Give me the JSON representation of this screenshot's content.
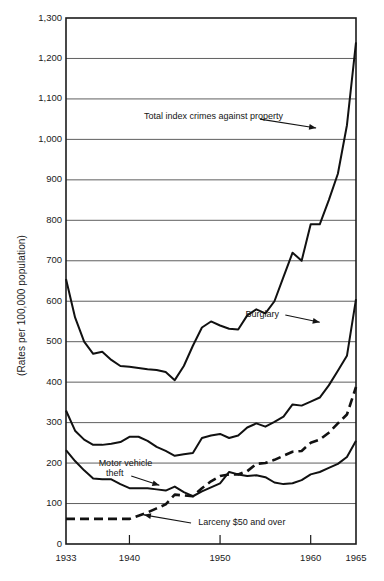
{
  "chart_data": {
    "type": "line",
    "title": "",
    "xlabel": "",
    "ylabel": "(Rates per 100,000 population)",
    "xlim": [
      1933,
      1965
    ],
    "ylim": [
      0,
      1300
    ],
    "grid": true,
    "legend_position": "inline-annotations",
    "y_ticks": [
      "0",
      "100",
      "200",
      "300",
      "400",
      "500",
      "600",
      "700",
      "800",
      "900",
      "1,000",
      "1,100",
      "1,200",
      "1,300"
    ],
    "y_tick_values": [
      0,
      100,
      200,
      300,
      400,
      500,
      600,
      700,
      800,
      900,
      1000,
      1100,
      1200,
      1300
    ],
    "x_ticks": [
      "1933",
      "1940",
      "1950",
      "1960",
      "1965"
    ],
    "x_tick_values": [
      1933,
      1940,
      1950,
      1960,
      1965
    ],
    "x": [
      1933,
      1934,
      1935,
      1936,
      1937,
      1938,
      1939,
      1940,
      1941,
      1942,
      1943,
      1944,
      1945,
      1946,
      1947,
      1948,
      1949,
      1950,
      1951,
      1952,
      1953,
      1954,
      1955,
      1956,
      1957,
      1958,
      1959,
      1960,
      1961,
      1962,
      1963,
      1964,
      1965
    ],
    "series": [
      {
        "name": "Total index crimes against property",
        "style": "solid",
        "color": "#111111",
        "values": [
          655,
          560,
          500,
          470,
          475,
          455,
          440,
          438,
          435,
          432,
          430,
          425,
          405,
          440,
          490,
          535,
          550,
          540,
          532,
          530,
          565,
          580,
          570,
          600,
          660,
          720,
          700,
          790,
          790,
          850,
          915,
          1035,
          1240
        ]
      },
      {
        "name": "Burglary",
        "style": "solid",
        "color": "#111111",
        "values": [
          330,
          280,
          258,
          245,
          245,
          248,
          252,
          265,
          265,
          255,
          240,
          230,
          218,
          222,
          225,
          262,
          268,
          272,
          262,
          268,
          288,
          298,
          290,
          302,
          315,
          345,
          342,
          352,
          362,
          392,
          428,
          465,
          605
        ]
      },
      {
        "name": "Motor vehicle theft",
        "style": "solid",
        "color": "#111111",
        "values": [
          232,
          205,
          182,
          162,
          160,
          160,
          148,
          138,
          138,
          138,
          135,
          132,
          142,
          128,
          118,
          130,
          140,
          150,
          178,
          172,
          168,
          170,
          165,
          152,
          148,
          150,
          158,
          172,
          178,
          188,
          198,
          215,
          255
        ]
      },
      {
        "name": "Larceny $50 and over",
        "style": "dashed",
        "color": "#111111",
        "values": [
          62,
          62,
          62,
          62,
          62,
          62,
          62,
          62,
          70,
          78,
          88,
          98,
          122,
          120,
          118,
          138,
          155,
          168,
          172,
          172,
          180,
          198,
          200,
          208,
          218,
          228,
          230,
          250,
          258,
          275,
          298,
          320,
          388
        ]
      }
    ],
    "annotations": [
      {
        "id": "total-index-label",
        "text": "Total index crimes against property",
        "x": 1941.6,
        "y": 1055,
        "arrow_to_x": 1960.8,
        "arrow_to_y": 1030
      },
      {
        "id": "burglary-label",
        "text": "Burglary",
        "x": 1952.8,
        "y": 567,
        "arrow_to_x": 1961.2,
        "arrow_to_y": 548
      },
      {
        "id": "motor-vehicle-theft-label-line1",
        "text": "Motor vehicle",
        "x": 1936.6,
        "y": 198,
        "arrow_to_x": 1943.4,
        "arrow_to_y": 146
      },
      {
        "id": "motor-vehicle-theft-label-line2",
        "text": "theft",
        "x": 1937.4,
        "y": 172,
        "arrow_to_x": 0,
        "arrow_to_y": 0
      },
      {
        "id": "larceny-label",
        "text": "Larceny $50 and over",
        "x": 1947.6,
        "y": 52,
        "arrow_to_x": 1941.4,
        "arrow_to_y": 70
      }
    ]
  },
  "caption": {
    "text": ""
  }
}
